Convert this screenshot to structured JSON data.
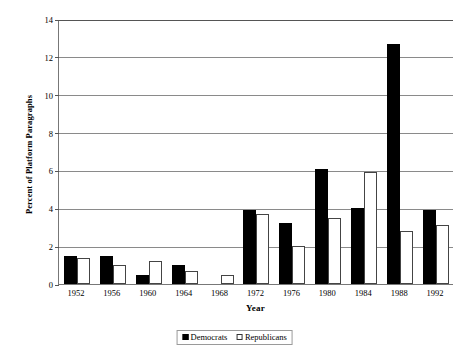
{
  "chart_data": {
    "type": "bar",
    "title": "",
    "xlabel": "Year",
    "ylabel": "Percent of Platform Paragraphs",
    "categories": [
      "1952",
      "1956",
      "1960",
      "1964",
      "1968",
      "1972",
      "1976",
      "1980",
      "1984",
      "1988",
      "1992"
    ],
    "ylim": [
      0,
      14
    ],
    "yticks": [
      0,
      2,
      4,
      6,
      8,
      10,
      12,
      14
    ],
    "ytick_labels": [
      "0",
      "2",
      "4",
      "6",
      "8",
      "10",
      "12",
      "14"
    ],
    "grid": true,
    "legend_position": "bottom-center",
    "series": [
      {
        "name": "Democrats",
        "color": "#000000",
        "values": [
          1.5,
          1.5,
          0.5,
          1.0,
          0.0,
          3.9,
          3.2,
          6.1,
          4.0,
          12.7,
          3.9
        ]
      },
      {
        "name": "Republicans",
        "color": "#ffffff",
        "values": [
          1.4,
          1.0,
          1.2,
          0.7,
          0.5,
          3.7,
          2.0,
          3.5,
          5.9,
          2.8,
          3.1
        ]
      }
    ]
  },
  "legend": {
    "items": [
      {
        "label": "Democrats",
        "swatch": "filled-black-square"
      },
      {
        "label": "Republicans",
        "swatch": "open-white-square"
      }
    ]
  }
}
